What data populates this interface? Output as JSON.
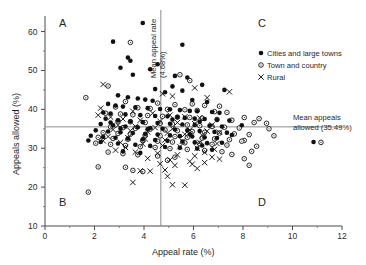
{
  "chart_data": {
    "type": "scatter",
    "title": "",
    "xlabel": "Appeal rate (%)",
    "ylabel": "Appeals allowed (%)",
    "xlim": [
      0,
      12
    ],
    "ylim": [
      10,
      64
    ],
    "xticks": [
      0,
      2,
      4,
      6,
      8,
      10,
      12
    ],
    "yticks": [
      10,
      20,
      30,
      40,
      50,
      60
    ],
    "xminorticks": [
      1,
      3,
      5,
      7,
      9,
      11
    ],
    "yminorticks": [
      15,
      25,
      35,
      45,
      55
    ],
    "grid": false,
    "legend_position": "top-right",
    "reference_lines": [
      {
        "name": "mean-appeal-rate",
        "orientation": "vertical",
        "value": 4.68,
        "label": "Mean appeal rate (4.68%)"
      },
      {
        "name": "mean-appeals-allowed",
        "orientation": "horizontal",
        "value": 35.49,
        "label": "Mean appeals allowed (35.49%)"
      }
    ],
    "quadrant_labels": [
      {
        "id": "A",
        "corner": "top-left"
      },
      {
        "id": "B",
        "corner": "bottom-left"
      },
      {
        "id": "C",
        "corner": "top-right"
      },
      {
        "id": "D",
        "corner": "bottom-right"
      }
    ],
    "series": [
      {
        "name": "Cities and large towns",
        "marker": "filled-circle",
        "color": "#111111",
        "points": [
          [
            3.95,
            62.2
          ],
          [
            2.75,
            57.4
          ],
          [
            5.55,
            56.6
          ],
          [
            3.35,
            53.3
          ],
          [
            3.45,
            52.5
          ],
          [
            4.55,
            51.6
          ],
          [
            3.05,
            50.7
          ],
          [
            4.25,
            50.3
          ],
          [
            3.55,
            48.9
          ],
          [
            5.25,
            48.6
          ],
          [
            5.75,
            48.2
          ],
          [
            6.35,
            46.3
          ],
          [
            5.15,
            45.9
          ],
          [
            4.45,
            45.2
          ],
          [
            5.55,
            44.8
          ],
          [
            4.85,
            44.4
          ],
          [
            7.25,
            45.0
          ],
          [
            2.95,
            43.6
          ],
          [
            3.35,
            43.1
          ],
          [
            3.75,
            42.8
          ],
          [
            4.05,
            42.5
          ],
          [
            4.35,
            42.2
          ],
          [
            5.95,
            42.4
          ],
          [
            6.55,
            41.9
          ],
          [
            2.55,
            41.4
          ],
          [
            2.85,
            41.0
          ],
          [
            3.15,
            40.7
          ],
          [
            3.65,
            40.5
          ],
          [
            4.15,
            40.3
          ],
          [
            4.65,
            40.1
          ],
          [
            5.05,
            40.0
          ],
          [
            5.45,
            39.8
          ],
          [
            5.85,
            39.6
          ],
          [
            6.15,
            39.5
          ],
          [
            6.75,
            39.3
          ],
          [
            7.05,
            39.1
          ],
          [
            2.35,
            39.2
          ],
          [
            2.65,
            38.9
          ],
          [
            3.25,
            38.7
          ],
          [
            3.85,
            38.5
          ],
          [
            4.45,
            38.3
          ],
          [
            4.95,
            38.2
          ],
          [
            5.35,
            38.0
          ],
          [
            5.65,
            37.8
          ],
          [
            6.05,
            37.6
          ],
          [
            6.45,
            37.5
          ],
          [
            6.95,
            37.3
          ],
          [
            7.45,
            37.1
          ],
          [
            2.45,
            37.6
          ],
          [
            2.95,
            37.2
          ],
          [
            3.45,
            36.9
          ],
          [
            3.95,
            36.7
          ],
          [
            4.55,
            36.5
          ],
          [
            5.05,
            36.3
          ],
          [
            5.55,
            36.1
          ],
          [
            6.05,
            36.0
          ],
          [
            6.65,
            35.8
          ],
          [
            7.15,
            35.6
          ],
          [
            7.95,
            35.9
          ],
          [
            2.25,
            36.2
          ],
          [
            2.75,
            35.9
          ],
          [
            3.25,
            35.6
          ],
          [
            3.75,
            35.4
          ],
          [
            4.25,
            35.2
          ],
          [
            4.75,
            35.0
          ],
          [
            5.25,
            34.8
          ],
          [
            5.75,
            34.6
          ],
          [
            6.25,
            34.4
          ],
          [
            6.85,
            34.2
          ],
          [
            7.35,
            34.0
          ],
          [
            2.05,
            34.6
          ],
          [
            2.55,
            34.3
          ],
          [
            3.05,
            34.1
          ],
          [
            3.55,
            33.9
          ],
          [
            4.05,
            33.7
          ],
          [
            4.55,
            33.5
          ],
          [
            5.05,
            33.3
          ],
          [
            5.45,
            33.1
          ],
          [
            5.95,
            33.0
          ],
          [
            6.45,
            32.8
          ],
          [
            6.95,
            32.6
          ],
          [
            1.85,
            33.2
          ],
          [
            2.35,
            32.9
          ],
          [
            2.85,
            32.7
          ],
          [
            3.35,
            32.5
          ],
          [
            3.95,
            32.3
          ],
          [
            4.45,
            32.1
          ],
          [
            4.95,
            31.9
          ],
          [
            5.55,
            31.7
          ],
          [
            6.05,
            31.5
          ],
          [
            6.55,
            31.3
          ],
          [
            1.75,
            32.0
          ],
          [
            2.25,
            31.6
          ],
          [
            2.95,
            31.2
          ],
          [
            3.65,
            30.9
          ],
          [
            4.25,
            30.6
          ],
          [
            4.85,
            30.3
          ],
          [
            5.45,
            30.1
          ],
          [
            6.15,
            29.9
          ],
          [
            6.75,
            29.6
          ],
          [
            3.15,
            29.2
          ],
          [
            3.85,
            28.8
          ],
          [
            7.15,
            31.4
          ],
          [
            6.35,
            30.7
          ],
          [
            10.85,
            31.6
          ],
          [
            5.85,
            33.6
          ],
          [
            4.15,
            34.9
          ],
          [
            6.25,
            36.8
          ],
          [
            7.55,
            33.4
          ],
          [
            5.15,
            37.4
          ],
          [
            2.65,
            36.6
          ],
          [
            3.05,
            35.1
          ]
        ]
      },
      {
        "name": "Town and country",
        "marker": "open-circle",
        "color": "#111111",
        "points": [
          [
            3.45,
            57.2
          ],
          [
            5.45,
            48.9
          ],
          [
            2.55,
            46.0
          ],
          [
            5.85,
            47.4
          ],
          [
            1.65,
            43.0
          ],
          [
            3.25,
            42.0
          ],
          [
            4.55,
            41.6
          ],
          [
            5.25,
            41.2
          ],
          [
            5.95,
            41.4
          ],
          [
            6.45,
            41.0
          ],
          [
            7.05,
            40.8
          ],
          [
            2.85,
            40.6
          ],
          [
            3.75,
            40.4
          ],
          [
            4.25,
            40.2
          ],
          [
            4.95,
            40.0
          ],
          [
            5.65,
            39.9
          ],
          [
            6.15,
            39.7
          ],
          [
            6.85,
            39.4
          ],
          [
            7.35,
            39.2
          ],
          [
            2.45,
            39.0
          ],
          [
            3.05,
            38.8
          ],
          [
            3.55,
            38.6
          ],
          [
            4.15,
            38.4
          ],
          [
            4.75,
            38.2
          ],
          [
            5.35,
            38.0
          ],
          [
            5.85,
            37.9
          ],
          [
            6.35,
            37.7
          ],
          [
            6.95,
            37.4
          ],
          [
            7.55,
            37.2
          ],
          [
            8.05,
            37.9
          ],
          [
            8.65,
            37.6
          ],
          [
            2.95,
            37.0
          ],
          [
            3.45,
            36.8
          ],
          [
            4.05,
            36.6
          ],
          [
            4.65,
            36.4
          ],
          [
            5.15,
            36.2
          ],
          [
            5.75,
            36.0
          ],
          [
            6.25,
            35.8
          ],
          [
            6.75,
            35.6
          ],
          [
            7.25,
            35.4
          ],
          [
            7.85,
            35.2
          ],
          [
            8.45,
            36.6
          ],
          [
            8.95,
            36.4
          ],
          [
            9.05,
            35.0
          ],
          [
            2.65,
            35.5
          ],
          [
            3.15,
            35.3
          ],
          [
            3.65,
            35.1
          ],
          [
            4.25,
            34.9
          ],
          [
            4.85,
            34.7
          ],
          [
            5.35,
            34.5
          ],
          [
            5.95,
            34.3
          ],
          [
            6.45,
            34.1
          ],
          [
            7.05,
            33.9
          ],
          [
            7.65,
            33.7
          ],
          [
            8.25,
            33.5
          ],
          [
            2.35,
            34.0
          ],
          [
            2.95,
            33.8
          ],
          [
            3.45,
            33.6
          ],
          [
            4.05,
            33.4
          ],
          [
            4.65,
            33.2
          ],
          [
            5.25,
            33.0
          ],
          [
            5.75,
            32.8
          ],
          [
            6.35,
            32.6
          ],
          [
            6.85,
            32.4
          ],
          [
            7.45,
            32.2
          ],
          [
            8.05,
            32.0
          ],
          [
            2.15,
            32.8
          ],
          [
            2.75,
            32.5
          ],
          [
            3.35,
            32.3
          ],
          [
            3.95,
            32.0
          ],
          [
            4.55,
            31.8
          ],
          [
            5.15,
            31.6
          ],
          [
            5.65,
            31.4
          ],
          [
            6.25,
            31.2
          ],
          [
            6.75,
            31.0
          ],
          [
            7.35,
            30.8
          ],
          [
            2.05,
            31.3
          ],
          [
            2.65,
            31.0
          ],
          [
            3.25,
            30.7
          ],
          [
            3.85,
            30.4
          ],
          [
            4.45,
            30.2
          ],
          [
            5.05,
            29.9
          ],
          [
            5.75,
            29.7
          ],
          [
            6.45,
            29.4
          ],
          [
            7.15,
            29.1
          ],
          [
            2.55,
            29.0
          ],
          [
            3.15,
            28.6
          ],
          [
            3.75,
            28.3
          ],
          [
            4.55,
            28.0
          ],
          [
            5.25,
            27.7
          ],
          [
            7.55,
            28.4
          ],
          [
            8.05,
            27.3
          ],
          [
            2.15,
            25.2
          ],
          [
            3.25,
            25.1
          ],
          [
            3.55,
            24.3
          ],
          [
            3.95,
            24.0
          ],
          [
            8.25,
            25.6
          ],
          [
            1.75,
            18.7
          ],
          [
            11.15,
            31.5
          ],
          [
            8.55,
            30.5
          ],
          [
            7.95,
            31.8
          ],
          [
            8.35,
            29.2
          ],
          [
            9.25,
            33.2
          ],
          [
            4.95,
            26.9
          ]
        ]
      },
      {
        "name": "Rural",
        "marker": "cross",
        "color": "#111111",
        "points": [
          [
            2.35,
            46.4
          ],
          [
            6.05,
            45.5
          ],
          [
            7.45,
            44.5
          ],
          [
            4.75,
            44.0
          ],
          [
            2.25,
            40.3
          ],
          [
            2.15,
            38.5
          ],
          [
            5.15,
            43.4
          ],
          [
            6.55,
            43.0
          ],
          [
            3.55,
            39.5
          ],
          [
            4.35,
            39.0
          ],
          [
            5.05,
            38.5
          ],
          [
            5.65,
            38.1
          ],
          [
            6.25,
            37.8
          ],
          [
            3.15,
            37.5
          ],
          [
            3.85,
            37.2
          ],
          [
            4.65,
            36.9
          ],
          [
            5.35,
            36.6
          ],
          [
            6.05,
            36.3
          ],
          [
            6.75,
            36.0
          ],
          [
            2.95,
            35.9
          ],
          [
            3.65,
            35.6
          ],
          [
            4.45,
            35.3
          ],
          [
            5.15,
            35.0
          ],
          [
            5.85,
            34.7
          ],
          [
            6.55,
            34.4
          ],
          [
            7.05,
            34.1
          ],
          [
            2.75,
            34.8
          ],
          [
            3.45,
            34.5
          ],
          [
            4.15,
            34.2
          ],
          [
            4.95,
            33.9
          ],
          [
            5.65,
            33.6
          ],
          [
            6.35,
            33.3
          ],
          [
            2.55,
            33.0
          ],
          [
            3.35,
            32.7
          ],
          [
            4.05,
            32.4
          ],
          [
            4.85,
            32.1
          ],
          [
            5.55,
            31.8
          ],
          [
            6.25,
            31.5
          ],
          [
            6.95,
            31.2
          ],
          [
            2.35,
            31.9
          ],
          [
            3.05,
            31.5
          ],
          [
            3.95,
            31.1
          ],
          [
            4.75,
            30.7
          ],
          [
            5.45,
            30.4
          ],
          [
            6.15,
            30.0
          ],
          [
            6.85,
            29.7
          ],
          [
            2.85,
            29.5
          ],
          [
            3.65,
            29.0
          ],
          [
            4.55,
            28.7
          ],
          [
            5.35,
            28.3
          ],
          [
            6.05,
            28.0
          ],
          [
            6.75,
            27.7
          ],
          [
            4.15,
            27.4
          ],
          [
            5.05,
            27.0
          ],
          [
            5.85,
            26.6
          ],
          [
            6.45,
            26.3
          ],
          [
            4.65,
            26.0
          ],
          [
            5.25,
            25.6
          ],
          [
            4.85,
            24.4
          ],
          [
            4.25,
            24.1
          ],
          [
            3.85,
            24.2
          ],
          [
            5.95,
            25.9
          ],
          [
            3.55,
            21.2
          ],
          [
            5.15,
            20.6
          ],
          [
            5.65,
            20.5
          ],
          [
            4.95,
            22.8
          ],
          [
            6.45,
            28.9
          ],
          [
            7.05,
            27.2
          ],
          [
            2.65,
            38.0
          ],
          [
            3.25,
            30.2
          ],
          [
            6.15,
            24.8
          ]
        ]
      }
    ]
  },
  "labels": {
    "mean_appeal_rate_line1": "Mean appeal rate",
    "mean_appeal_rate_line2": "(4.68%)",
    "mean_allowed_line1": "Mean appeals",
    "mean_allowed_line2": "allowed (35.49%)",
    "quad_a": "A",
    "quad_b": "B",
    "quad_c": "C",
    "quad_d": "D"
  }
}
